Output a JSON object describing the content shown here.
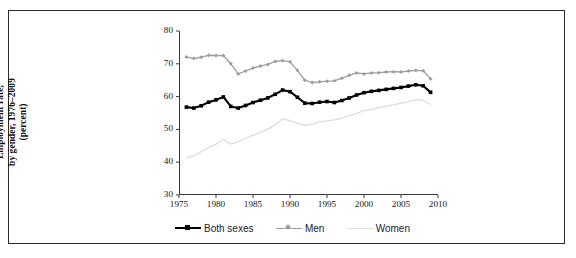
{
  "figure": {
    "y_axis_title_line1": "Employment rate,",
    "y_axis_title_line2": "by gender, 1976–2009",
    "y_axis_title_line3": "(percent)"
  },
  "legend": {
    "position": "bottom",
    "items": [
      {
        "label": "Both sexes",
        "color": "#000000",
        "marker": "square"
      },
      {
        "label": "Men",
        "color": "#9d9d9d",
        "marker": "diamond"
      },
      {
        "label": "Women",
        "color": "#dcdcdc",
        "marker": "none"
      }
    ]
  },
  "colors": {
    "both_sexes": "#000000",
    "men": "#9d9d9d",
    "women": "#dcdcdc",
    "axis": "#3a3a3a",
    "border": "#2b2b2b",
    "text": "#161616"
  },
  "chart_data": {
    "type": "line",
    "title": "",
    "subtitle": "",
    "xlabel": "",
    "ylabel": "Employment rate, by gender, 1976–2009 (percent)",
    "xlim": [
      1975,
      2010
    ],
    "ylim": [
      30,
      80
    ],
    "xticks": [
      1975,
      1980,
      1985,
      1990,
      1995,
      2000,
      2005,
      2010
    ],
    "yticks": [
      30,
      40,
      50,
      60,
      70,
      80
    ],
    "grid": false,
    "legend_position": "bottom",
    "x": [
      1976,
      1977,
      1978,
      1979,
      1980,
      1981,
      1982,
      1983,
      1984,
      1985,
      1986,
      1987,
      1988,
      1989,
      1990,
      1991,
      1992,
      1993,
      1994,
      1995,
      1996,
      1997,
      1998,
      1999,
      2000,
      2001,
      2002,
      2003,
      2004,
      2005,
      2006,
      2007,
      2008,
      2009
    ],
    "series": [
      {
        "name": "Both sexes",
        "color": "#000000",
        "marker": "square",
        "values": [
          56.8,
          56.5,
          57.2,
          58.3,
          59.0,
          59.9,
          57.0,
          56.5,
          57.3,
          58.2,
          58.9,
          59.6,
          60.7,
          62.0,
          61.5,
          59.8,
          58.0,
          57.9,
          58.3,
          58.5,
          58.2,
          58.8,
          59.6,
          60.5,
          61.2,
          61.6,
          61.9,
          62.2,
          62.5,
          62.8,
          63.2,
          63.6,
          63.3,
          61.3
        ]
      },
      {
        "name": "Men",
        "color": "#9d9d9d",
        "marker": "diamond",
        "values": [
          72.1,
          71.6,
          72.0,
          72.6,
          72.5,
          72.5,
          70.0,
          66.9,
          67.8,
          68.7,
          69.3,
          69.8,
          70.7,
          71.0,
          70.6,
          68.0,
          65.0,
          64.3,
          64.5,
          64.7,
          64.8,
          65.6,
          66.5,
          67.2,
          66.9,
          67.2,
          67.3,
          67.5,
          67.6,
          67.5,
          67.8,
          68.0,
          67.9,
          65.4
        ]
      },
      {
        "name": "Women",
        "color": "#dcdcdc",
        "marker": "none",
        "values": [
          41.3,
          41.9,
          43.2,
          44.5,
          45.5,
          47.0,
          45.5,
          46.2,
          47.3,
          48.2,
          49.1,
          50.0,
          51.5,
          53.2,
          52.7,
          51.9,
          51.2,
          51.6,
          52.3,
          52.6,
          52.9,
          53.4,
          54.2,
          54.9,
          55.7,
          56.1,
          56.6,
          57.1,
          57.5,
          58.0,
          58.5,
          59.1,
          58.9,
          57.5
        ]
      }
    ]
  }
}
